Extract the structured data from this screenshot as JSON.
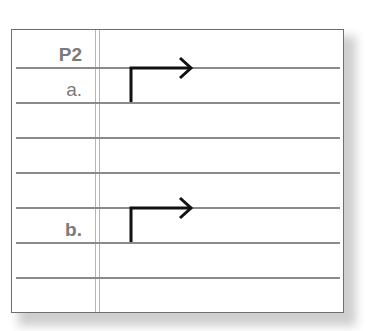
{
  "worksheet": {
    "rows": [
      {
        "label": "P2",
        "has_arrow": false
      },
      {
        "label": "a.",
        "has_arrow": true
      },
      {
        "label": "",
        "has_arrow": false
      },
      {
        "label": "",
        "has_arrow": false
      },
      {
        "label": "",
        "has_arrow": false
      },
      {
        "label": "b.",
        "has_arrow": true
      },
      {
        "label": "",
        "has_arrow": false
      },
      {
        "label": "",
        "has_arrow": false
      }
    ],
    "label_p2": "P2",
    "label_a": "a.",
    "label_b": "b.",
    "colors": {
      "rule": "#8a8a8a",
      "margin": "#b5b5b5",
      "frame": "#6e6e6e",
      "label": "#7a7a7a",
      "arrow": "#111111"
    }
  }
}
